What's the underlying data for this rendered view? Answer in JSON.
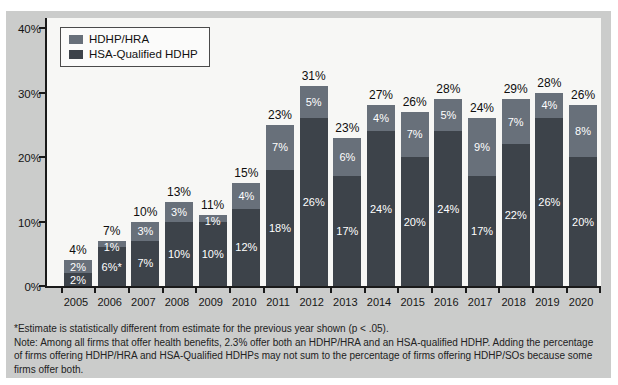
{
  "colors": {
    "panel_bg": "#cbcccb",
    "plot_bg": "#f7f7f5",
    "hra": "#68707a",
    "hsa": "#3d434a",
    "axis": "#1a1a1a",
    "segment_label": "#ffffff",
    "total_label": "#0e0e0e"
  },
  "legend": {
    "items": [
      {
        "label": "HDHP/HRA",
        "color_key": "hra"
      },
      {
        "label": "HSA-Qualified HDHP",
        "color_key": "hsa"
      }
    ]
  },
  "chart_data": {
    "type": "bar",
    "stacked": true,
    "title": "",
    "xlabel": "",
    "ylabel": "",
    "ylim": [
      0,
      40
    ],
    "grid": false,
    "legend_position": "top-left",
    "yticks": [
      {
        "value": 0,
        "label": "0%"
      },
      {
        "value": 10,
        "label": "10%"
      },
      {
        "value": 20,
        "label": "20%"
      },
      {
        "value": 30,
        "label": "30%"
      },
      {
        "value": 40,
        "label": "40%"
      }
    ],
    "categories": [
      "2005",
      "2006",
      "2007",
      "2008",
      "2009",
      "2010",
      "2011",
      "2012",
      "2013",
      "2014",
      "2015",
      "2016",
      "2017",
      "2018",
      "2019",
      "2020"
    ],
    "series": [
      {
        "name": "HDHP/HRA",
        "stack": "top",
        "color_key": "hra",
        "values": [
          2,
          1,
          3,
          3,
          1,
          4,
          7,
          5,
          6,
          4,
          7,
          5,
          9,
          7,
          4,
          8
        ],
        "labels": [
          "2%",
          "1%",
          "3%",
          "3%",
          "1%",
          "4%",
          "7%",
          "5%",
          "6%",
          "4%",
          "7%",
          "5%",
          "9%",
          "7%",
          "4%",
          "8%"
        ]
      },
      {
        "name": "HSA-Qualified HDHP",
        "stack": "bottom",
        "color_key": "hsa",
        "values": [
          2,
          6,
          7,
          10,
          10,
          12,
          18,
          26,
          17,
          24,
          20,
          24,
          17,
          22,
          26,
          20
        ],
        "labels": [
          "2%",
          "6%*",
          "7%",
          "10%",
          "10%",
          "12%",
          "18%",
          "26%",
          "17%",
          "24%",
          "20%",
          "24%",
          "17%",
          "22%",
          "26%",
          "20%"
        ]
      }
    ],
    "totals": {
      "values": [
        4,
        7,
        10,
        13,
        11,
        15,
        23,
        31,
        23,
        27,
        26,
        28,
        24,
        29,
        28,
        26
      ],
      "labels": [
        "4%",
        "7%",
        "10%",
        "13%",
        "11%",
        "15%",
        "23%",
        "31%",
        "23%",
        "27%",
        "26%",
        "28%",
        "24%",
        "29%",
        "28%",
        "26%"
      ]
    }
  },
  "footnotes": [
    "*Estimate is statistically different from estimate for the previous year shown (p < .05).",
    "Note: Among all firms that offer health benefits, 2.3% offer both an HDHP/HRA and an HSA-qualified HDHP. Adding the percentage of firms offering HDHP/HRA and HSA-Qualified HDHPs may not sum to the percentage of firms offering HDHP/SOs because some firms offer both."
  ]
}
